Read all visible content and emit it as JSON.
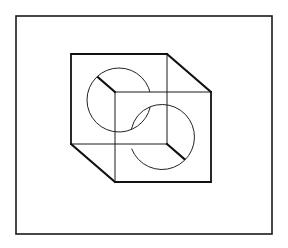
{
  "figure": {
    "colors": {
      "background": "#ffffff",
      "line": "#1a1a1a"
    },
    "frame": {
      "x1": 16,
      "y1": 16,
      "x2": 272,
      "y2": 234
    },
    "cube": {
      "back_square": {
        "x1": 71,
        "y1": 54,
        "x2": 167,
        "y2": 144
      },
      "front_square": {
        "x1": 115,
        "y1": 92,
        "x2": 211,
        "y2": 182
      }
    },
    "circles": [
      {
        "name": "upper-left-circle",
        "cx": 119,
        "cy": 100,
        "r": 32
      },
      {
        "name": "lower-right-circle",
        "cx": 162,
        "cy": 137,
        "r": 32.5
      }
    ]
  }
}
